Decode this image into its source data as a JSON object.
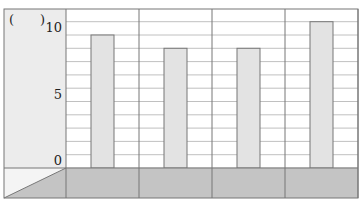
{
  "chart_data": {
    "type": "bar",
    "title": "",
    "unit_label": "(　　)",
    "xlabel": "",
    "ylabel": "",
    "categories": [
      "",
      "",
      "",
      ""
    ],
    "values": [
      10,
      9,
      9,
      11
    ],
    "ylim": [
      0,
      12
    ],
    "yticks": [
      0,
      5,
      10
    ],
    "minor_grid_step": 1,
    "grid": true,
    "legend": null
  },
  "colors": {
    "bar_fill": "#e3e3e3",
    "bar_stroke": "#777777",
    "axis_panel": "#ececec",
    "category_band": "#c4c4c4",
    "grid": "#b0b0b0",
    "frame": "#777777"
  }
}
